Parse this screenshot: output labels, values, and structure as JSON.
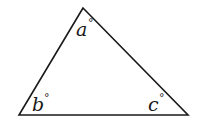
{
  "diagram": {
    "type": "triangle",
    "stroke_color": "#1a1a1a",
    "background": "#ffffff",
    "vertices": {
      "top": [
        83,
        8
      ],
      "bottom_left": [
        19,
        115
      ],
      "bottom_right": [
        188,
        115
      ]
    },
    "angles": [
      {
        "id": "a",
        "vertex": "top",
        "letter": "a",
        "unit": "°"
      },
      {
        "id": "b",
        "vertex": "bottom_left",
        "letter": "b",
        "unit": "°"
      },
      {
        "id": "c",
        "vertex": "bottom_right",
        "letter": "c",
        "unit": "°"
      }
    ]
  }
}
